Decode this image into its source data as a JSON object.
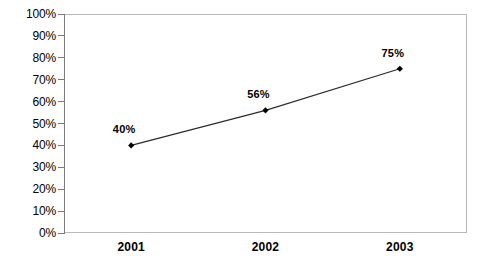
{
  "chart_data": {
    "type": "line",
    "title": "",
    "subtitle": "",
    "xlabel": "",
    "ylabel": "",
    "categories": [
      "2001",
      "2002",
      "2003"
    ],
    "values": [
      40,
      56,
      75
    ],
    "point_labels": [
      "40%",
      "56%",
      "75%"
    ],
    "ylim": [
      0,
      100
    ],
    "y_ticks": [
      0,
      10,
      20,
      30,
      40,
      50,
      60,
      70,
      80,
      90,
      100
    ],
    "y_tick_labels": [
      "0%",
      "10%",
      "20%",
      "30%",
      "40%",
      "50%",
      "60%",
      "70%",
      "80%",
      "90%",
      "100%"
    ],
    "grid": false,
    "legend": false,
    "legend_position": "none",
    "series": [
      {
        "name": "",
        "values": [
          40,
          56,
          75
        ]
      }
    ],
    "colors": {
      "line": "#2b2b2b",
      "marker": "#000000",
      "frame": "#b9b9b9",
      "axis": "#7a7a7a",
      "text": "#000000",
      "background": "#ffffff"
    },
    "marker_shape": "diamond"
  }
}
